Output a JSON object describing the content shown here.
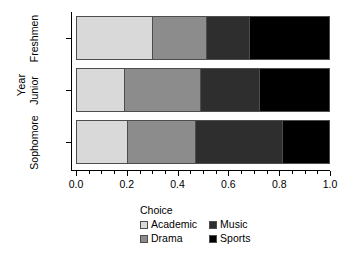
{
  "chart_data": {
    "type": "bar",
    "orientation": "horizontal",
    "stacked": true,
    "normalized": true,
    "title": "",
    "xlabel": "",
    "ylabel": "Year",
    "categories": [
      "Freshmen",
      "Junior",
      "Sophomore"
    ],
    "series": [
      {
        "name": "Academic",
        "color": "#d9d9d9",
        "values": [
          0.3,
          0.19,
          0.2
        ]
      },
      {
        "name": "Drama",
        "color": "#8c8c8c",
        "values": [
          0.21,
          0.3,
          0.27
        ]
      },
      {
        "name": "Music",
        "color": "#2e2e2e",
        "values": [
          0.17,
          0.23,
          0.34
        ]
      },
      {
        "name": "Sports",
        "color": "#000000",
        "values": [
          0.32,
          0.28,
          0.19
        ]
      }
    ],
    "xlim": [
      0.0,
      1.0
    ],
    "xticks": [
      0.0,
      0.2,
      0.4,
      0.6,
      0.8,
      1.0
    ],
    "xtick_labels": [
      "0.0",
      "0.2",
      "0.4",
      "0.6",
      "0.8",
      "1.0"
    ],
    "x_minor_ticks": [
      0.05,
      0.1,
      0.15,
      0.25,
      0.3,
      0.35,
      0.45,
      0.5,
      0.55,
      0.65,
      0.7,
      0.75,
      0.85,
      0.9,
      0.95
    ],
    "grid": false,
    "legend": {
      "title": "Choice",
      "position": "bottom",
      "entries": [
        "Academic",
        "Drama",
        "Music",
        "Sports"
      ]
    }
  },
  "axes": {
    "y_title": "Year",
    "y_tick_labels": [
      "Freshmen",
      "Junior",
      "Sophomore"
    ],
    "x_tick_labels": [
      "0.0",
      "0.2",
      "0.4",
      "0.6",
      "0.8",
      "1.0"
    ]
  },
  "legend": {
    "title": "Choice",
    "column_left": [
      {
        "label": "Academic",
        "color": "#d9d9d9"
      },
      {
        "label": "Drama",
        "color": "#8c8c8c"
      }
    ],
    "column_right": [
      {
        "label": "Music",
        "color": "#2e2e2e"
      },
      {
        "label": "Sports",
        "color": "#000000"
      }
    ]
  }
}
